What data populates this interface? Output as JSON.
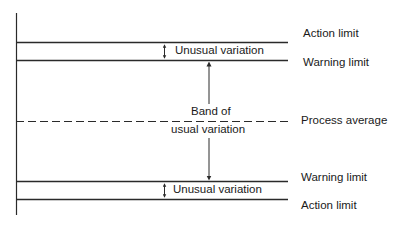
{
  "diagram": {
    "type": "control-chart-limits",
    "right_labels": {
      "action_top": "Action limit",
      "warning_top": "Warning limit",
      "process_average": "Process average",
      "warning_bottom": "Warning limit",
      "action_bottom": "Action limit"
    },
    "inner_labels": {
      "unusual_top": "Unusual variation",
      "band_line1": "Band of",
      "band_line2": "usual variation",
      "unusual_bottom": "Unusual variation"
    },
    "colors": {
      "line": "#2a2a2a",
      "background": "#ffffff"
    }
  }
}
